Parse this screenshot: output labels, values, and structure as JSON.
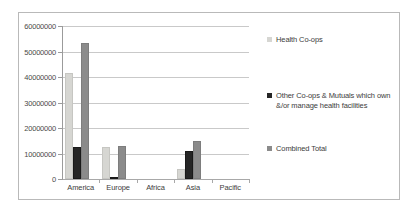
{
  "chart_data": {
    "type": "bar",
    "title": "",
    "xlabel": "",
    "ylabel": "",
    "categories": [
      "America",
      "Europe",
      "Africa",
      "Asia",
      "Pacific"
    ],
    "ylim": [
      0,
      60000000
    ],
    "yticks": [
      0,
      10000000,
      20000000,
      30000000,
      40000000,
      50000000,
      60000000
    ],
    "ytick_labels": [
      "0",
      "10000000",
      "20000000",
      "30000000",
      "40000000",
      "50000000",
      "60000000"
    ],
    "grid": true,
    "legend_position": "right",
    "series": [
      {
        "name": "Health Co-ops",
        "color": "#d6d6d2",
        "values": [
          41500000,
          12500000,
          0,
          4000000,
          0
        ]
      },
      {
        "name": "Other Co-ops & Mutuals which own &/or manage health facilities",
        "color": "#262626",
        "values": [
          12500000,
          500000,
          0,
          11000000,
          0
        ]
      },
      {
        "name": "Combined Total",
        "color": "#8b8b8b",
        "values": [
          53500000,
          13000000,
          0,
          15000000,
          0
        ]
      }
    ]
  },
  "legend": {
    "entries": [
      {
        "label": "Health Co-ops"
      },
      {
        "label": "Other Co-ops & Mutuals which own &/or manage health facilities"
      },
      {
        "label": "Combined Total"
      }
    ]
  }
}
